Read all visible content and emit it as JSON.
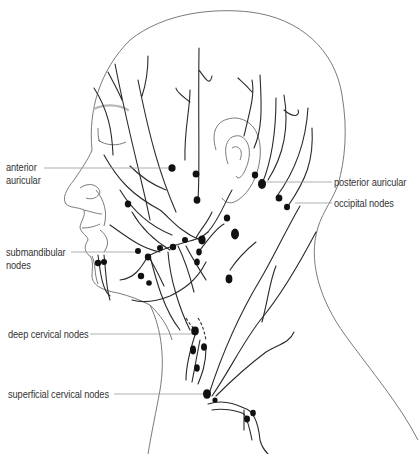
{
  "diagram": {
    "labels": {
      "anterior_auricular_line1": "anterior",
      "anterior_auricular_line2": "auricular",
      "submandibular_line1": "submandibular",
      "submandibular_line2": "nodes",
      "posterior_auricular": "posterior auricular",
      "occipital_nodes": "occipital nodes",
      "deep_cervical_nodes": "deep cervical nodes",
      "superficial_cervical_nodes": "superficial cervical nodes"
    },
    "colors": {
      "outline": "#7a7a7a",
      "vessel": "#2a2a2a",
      "node": "#111111",
      "leader_line": "#9a9a9a",
      "text": "#333333"
    }
  }
}
